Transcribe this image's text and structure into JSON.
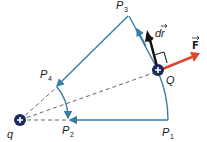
{
  "diagram": {
    "colors": {
      "path": "#3a7ca5",
      "dashed": "#555555",
      "charge": "#1c2a5a",
      "force": "#e0442a",
      "displacement": "#111111"
    },
    "charges": {
      "source": {
        "label": "q",
        "sign": "+"
      },
      "test": {
        "label": "Q",
        "sign": "+"
      }
    },
    "points": {
      "p1": {
        "base": "P",
        "sub": "1"
      },
      "p2": {
        "base": "P",
        "sub": "2"
      },
      "p3": {
        "base": "P",
        "sub": "3"
      },
      "p4": {
        "base": "P",
        "sub": "4"
      }
    },
    "vectors": {
      "force": {
        "label": "F"
      },
      "displacement": {
        "label": "dr"
      }
    }
  }
}
